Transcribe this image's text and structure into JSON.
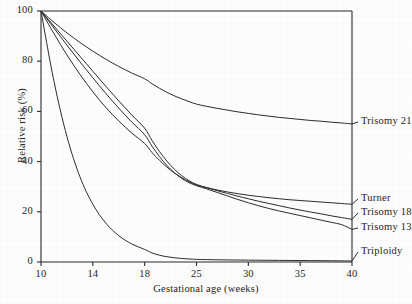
{
  "figure": {
    "background_color": "#fdfdfd",
    "ink_color": "#2b2b2b"
  },
  "chart_data": {
    "type": "line",
    "title": "",
    "xlabel": "Gestational age (weeks)",
    "ylabel": "Relative risk (%)",
    "xlim": [
      10,
      40
    ],
    "ylim": [
      0,
      100
    ],
    "grid": false,
    "legend_position": "right-of-axes-inline",
    "xticks": [
      10,
      14,
      18,
      25,
      30,
      35,
      40
    ],
    "xtick_labels": [
      "10",
      "14",
      "18",
      "25",
      "30",
      "35",
      "40"
    ],
    "xtick_positions_px": [
      41,
      110,
      178,
      266,
      326,
      386,
      446
    ],
    "yticks": [
      0,
      20,
      40,
      60,
      80,
      100
    ],
    "ytick_labels": [
      "0",
      "20",
      "40",
      "60",
      "80",
      "100"
    ],
    "x": [
      10,
      11,
      12,
      13,
      14,
      15,
      16,
      17,
      18,
      19,
      20,
      21,
      22,
      23,
      24,
      25,
      26,
      27,
      28,
      29,
      30,
      31,
      32,
      33,
      34,
      35,
      36,
      37,
      38,
      39,
      40
    ],
    "series": [
      {
        "name": "Trisomy 21",
        "label": "Trisomy 21",
        "end_value": 55,
        "values": [
          100,
          95.5,
          91.3,
          87.5,
          84.0,
          80.8,
          77.9,
          75.3,
          73.0,
          71.0,
          69.2,
          67.6,
          66.2,
          65.0,
          63.9,
          62.9,
          62.0,
          61.2,
          60.5,
          59.8,
          59.2,
          58.6,
          58.1,
          57.6,
          57.2,
          56.8,
          56.4,
          56.1,
          55.7,
          55.4,
          55.0
        ]
      },
      {
        "name": "Turner",
        "label": "Turner",
        "end_value": 23,
        "values": [
          100,
          91.0,
          82.5,
          74.8,
          67.8,
          61.6,
          56.2,
          51.4,
          47.2,
          43.6,
          40.5,
          37.8,
          35.5,
          33.6,
          32.0,
          30.7,
          29.6,
          28.7,
          27.9,
          27.2,
          26.6,
          26.1,
          25.6,
          25.2,
          24.8,
          24.5,
          24.2,
          23.9,
          23.6,
          23.3,
          23.0
        ]
      },
      {
        "name": "Trisomy 18",
        "label": "Trisomy 18",
        "end_value": 17,
        "values": [
          100,
          94.0,
          88.0,
          82.0,
          76.0,
          70.0,
          64.2,
          58.6,
          53.3,
          48.4,
          44.0,
          40.2,
          37.0,
          34.4,
          32.4,
          30.9,
          29.6,
          28.4,
          27.3,
          26.2,
          25.2,
          24.2,
          23.3,
          22.4,
          21.5,
          20.7,
          19.9,
          19.2,
          18.4,
          17.7,
          17.0
        ]
      },
      {
        "name": "Trisomy 13",
        "label": "Trisomy 13",
        "end_value": 13,
        "values": [
          100,
          93.2,
          86.4,
          79.8,
          73.4,
          67.2,
          61.3,
          55.8,
          50.7,
          46.1,
          42.0,
          38.5,
          35.6,
          33.3,
          31.6,
          30.4,
          29.1,
          27.7,
          26.3,
          24.9,
          23.6,
          22.4,
          21.3,
          20.3,
          19.4,
          18.5,
          17.6,
          16.7,
          15.8,
          14.9,
          13.0
        ]
      },
      {
        "name": "Triploidy",
        "label": "Triploidy",
        "end_value": 0.4,
        "values": [
          100,
          72.0,
          50.0,
          34.0,
          23.0,
          15.5,
          10.5,
          7.2,
          5.0,
          3.6,
          2.7,
          2.1,
          1.7,
          1.4,
          1.2,
          1.05,
          0.95,
          0.88,
          0.82,
          0.78,
          0.74,
          0.7,
          0.67,
          0.64,
          0.61,
          0.58,
          0.55,
          0.52,
          0.49,
          0.45,
          0.4
        ]
      }
    ]
  }
}
